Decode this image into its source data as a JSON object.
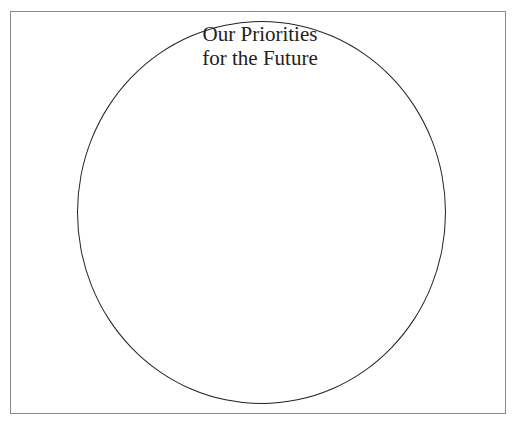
{
  "diagram": {
    "title_line1": "Our Priorities",
    "title_line2": "for the Future",
    "shapes": [
      {
        "type": "rectangle",
        "role": "frame"
      },
      {
        "type": "circle",
        "role": "empty priorities circle"
      }
    ]
  }
}
